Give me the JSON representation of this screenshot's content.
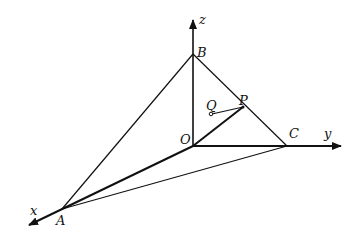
{
  "diagram": {
    "type": "3d-coordinate-axes",
    "axes": {
      "x": {
        "label": "x"
      },
      "y": {
        "label": "y"
      },
      "z": {
        "label": "z"
      }
    },
    "points": {
      "O": {
        "label": "O"
      },
      "A": {
        "label": "A"
      },
      "B": {
        "label": "B"
      },
      "C": {
        "label": "C"
      },
      "P": {
        "label": "P"
      },
      "Q": {
        "label": "Q"
      }
    },
    "segments": [
      "AB",
      "BC",
      "CA",
      "OP",
      "QP"
    ],
    "colors": {
      "ink": "#111111",
      "background": "#ffffff"
    }
  }
}
